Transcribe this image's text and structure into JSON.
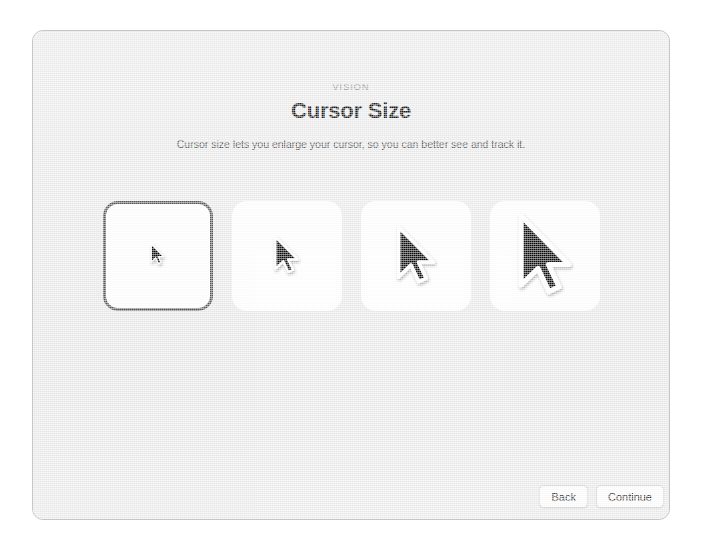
{
  "window": {
    "background_color": "#ebebeb",
    "border_color": "#c6c6c6"
  },
  "header": {
    "eyebrow": "VISION",
    "title": "Cursor Size",
    "subtitle": "Cursor size lets you enlarge your cursor, so you can better see and track it."
  },
  "cursor_options": {
    "selected_index": 0,
    "selected_border_color": "#5b5b5b",
    "card_background": "#ffffff",
    "items": [
      {
        "icon": "arrow-cursor-icon",
        "size_label": "Smallest",
        "cursor_px": 15,
        "selected": true
      },
      {
        "icon": "arrow-cursor-icon",
        "size_label": "Small",
        "cursor_px": 27,
        "selected": false
      },
      {
        "icon": "arrow-cursor-icon",
        "size_label": "Medium",
        "cursor_px": 42,
        "selected": false
      },
      {
        "icon": "arrow-cursor-icon",
        "size_label": "Large",
        "cursor_px": 58,
        "selected": false
      }
    ]
  },
  "footer": {
    "back_label": "Back",
    "continue_label": "Continue"
  }
}
